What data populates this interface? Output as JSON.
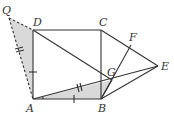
{
  "diagram": {
    "points": {
      "Q": {
        "label": "Q",
        "x": 9,
        "y": 18
      },
      "D": {
        "label": "D",
        "x": 33,
        "y": 30
      },
      "C": {
        "label": "C",
        "x": 101,
        "y": 30
      },
      "A": {
        "label": "A",
        "x": 33,
        "y": 99
      },
      "B": {
        "label": "B",
        "x": 101,
        "y": 99
      },
      "F": {
        "label": "F",
        "x": 131,
        "y": 45
      },
      "E": {
        "label": "E",
        "x": 158,
        "y": 66
      },
      "G": {
        "label": "G",
        "x": 112,
        "y": 80
      }
    },
    "colors": {
      "line": "#333333",
      "shade": "#d9d9d9"
    }
  }
}
